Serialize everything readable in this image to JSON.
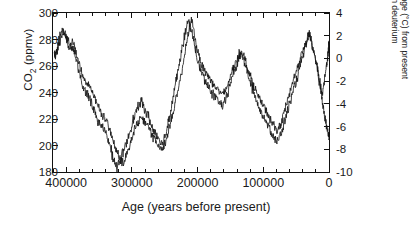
{
  "chart_data": {
    "type": "line",
    "title": "",
    "xlabel": "Age (years before present)",
    "ylabel": "CO2 (ppmv)",
    "ylabel_right_line1": "Temperature change (°C) from present",
    "ylabel_right_line2": "based on deuterium",
    "xlim": [
      420000,
      0
    ],
    "x_reversed": true,
    "ylim": [
      180,
      300
    ],
    "ylim_right": [
      -10,
      4
    ],
    "grid": false,
    "legend": false,
    "xticks": [
      400000,
      300000,
      200000,
      100000,
      0
    ],
    "xtick_labels": [
      "400000",
      "300000",
      "200000",
      "100000",
      "0"
    ],
    "x_minor_tick_interval": 20000,
    "yticks": [
      180,
      200,
      220,
      240,
      260,
      280,
      300
    ],
    "ytick_labels": [
      "180",
      "200",
      "220",
      "240",
      "260",
      "280",
      "300"
    ],
    "yticks_right": [
      -10,
      -8,
      -6,
      -4,
      -2,
      0,
      2,
      4
    ],
    "ytick_labels_right": [
      "-10",
      "-8",
      "-6",
      "-4",
      "-2",
      "0",
      "2",
      "4"
    ],
    "line_color": "#111111",
    "line_width": 0.8,
    "series": [
      {
        "name": "CO2",
        "axis": "left",
        "x": [
          418000,
          414000,
          410000,
          406000,
          402000,
          398000,
          394000,
          390000,
          386000,
          382000,
          378000,
          374000,
          370000,
          366000,
          362000,
          358000,
          354000,
          350000,
          346000,
          342000,
          338000,
          334000,
          330000,
          326000,
          322000,
          318000,
          314000,
          310000,
          306000,
          302000,
          298000,
          294000,
          290000,
          286000,
          282000,
          278000,
          274000,
          270000,
          266000,
          262000,
          258000,
          254000,
          250000,
          246000,
          242000,
          238000,
          234000,
          230000,
          226000,
          222000,
          218000,
          214000,
          210000,
          206000,
          202000,
          198000,
          194000,
          190000,
          186000,
          182000,
          178000,
          174000,
          170000,
          166000,
          162000,
          158000,
          154000,
          150000,
          146000,
          142000,
          138000,
          134000,
          130000,
          126000,
          122000,
          118000,
          114000,
          110000,
          106000,
          102000,
          98000,
          94000,
          90000,
          86000,
          82000,
          78000,
          74000,
          70000,
          66000,
          62000,
          58000,
          54000,
          50000,
          46000,
          42000,
          38000,
          34000,
          30000,
          26000,
          22000,
          18000,
          15000,
          12000,
          10000,
          8000,
          6000,
          4000,
          2000,
          1000,
          0
        ],
        "y": [
          268,
          272,
          278,
          283,
          285,
          281,
          276,
          279,
          272,
          266,
          258,
          252,
          249,
          247,
          243,
          238,
          232,
          228,
          224,
          221,
          218,
          212,
          206,
          199,
          194,
          190,
          187,
          190,
          196,
          203,
          209,
          214,
          218,
          221,
          219,
          216,
          213,
          208,
          205,
          202,
          199,
          197,
          201,
          208,
          216,
          224,
          232,
          241,
          250,
          262,
          273,
          284,
          296,
          288,
          276,
          268,
          262,
          258,
          254,
          251,
          248,
          245,
          243,
          240,
          238,
          241,
          246,
          252,
          258,
          263,
          268,
          272,
          268,
          262,
          256,
          250,
          244,
          240,
          236,
          232,
          228,
          224,
          220,
          217,
          214,
          211,
          215,
          222,
          229,
          236,
          243,
          250,
          256,
          262,
          268,
          274,
          280,
          285,
          278,
          268,
          258,
          248,
          240,
          232,
          226,
          220,
          215,
          212,
          208,
          205
        ],
        "y_notes": "CO2 in ppmv; Vostok-style glacial-interglacial cycles"
      },
      {
        "name": "Temperature (deuterium)",
        "axis": "right",
        "x": [
          418000,
          414000,
          410000,
          406000,
          402000,
          398000,
          394000,
          390000,
          386000,
          382000,
          378000,
          374000,
          370000,
          366000,
          362000,
          358000,
          354000,
          350000,
          346000,
          342000,
          338000,
          334000,
          330000,
          326000,
          322000,
          318000,
          314000,
          310000,
          306000,
          302000,
          298000,
          294000,
          290000,
          286000,
          282000,
          278000,
          274000,
          270000,
          266000,
          262000,
          258000,
          254000,
          250000,
          246000,
          242000,
          238000,
          234000,
          230000,
          226000,
          222000,
          218000,
          214000,
          210000,
          206000,
          202000,
          198000,
          194000,
          190000,
          186000,
          182000,
          178000,
          174000,
          170000,
          166000,
          162000,
          158000,
          154000,
          150000,
          146000,
          142000,
          138000,
          134000,
          130000,
          126000,
          122000,
          118000,
          114000,
          110000,
          106000,
          102000,
          98000,
          94000,
          90000,
          86000,
          82000,
          78000,
          74000,
          70000,
          66000,
          62000,
          58000,
          54000,
          50000,
          46000,
          42000,
          38000,
          34000,
          30000,
          26000,
          22000,
          18000,
          15000,
          12000,
          10000,
          8000,
          6000,
          4000,
          2000,
          1000,
          0
        ],
        "y": [
          0.2,
          0.8,
          1.8,
          2.4,
          2.2,
          1.4,
          0.6,
          1.0,
          0.2,
          -0.8,
          -1.8,
          -2.6,
          -3.0,
          -3.2,
          -3.8,
          -4.4,
          -5.2,
          -5.6,
          -6.0,
          -6.4,
          -6.8,
          -7.6,
          -8.4,
          -9.2,
          -9.6,
          -9.0,
          -8.4,
          -7.8,
          -7.0,
          -6.2,
          -5.4,
          -4.8,
          -4.2,
          -3.8,
          -4.2,
          -4.8,
          -5.2,
          -6.0,
          -6.4,
          -6.8,
          -7.2,
          -7.6,
          -7.0,
          -6.0,
          -4.8,
          -3.6,
          -2.4,
          -1.2,
          0.0,
          1.4,
          2.4,
          3.2,
          2.6,
          1.6,
          0.4,
          -0.6,
          -1.2,
          -1.8,
          -2.2,
          -2.6,
          -3.0,
          -3.4,
          -3.6,
          -4.0,
          -4.2,
          -3.8,
          -3.0,
          -2.2,
          -1.4,
          -0.8,
          -0.2,
          0.4,
          0.0,
          -0.8,
          -1.6,
          -2.4,
          -3.2,
          -3.8,
          -4.4,
          -4.8,
          -5.2,
          -5.8,
          -6.2,
          -6.6,
          -7.0,
          -7.4,
          -6.8,
          -6.0,
          -5.2,
          -4.4,
          -3.6,
          -2.8,
          -2.0,
          -1.2,
          -0.4,
          0.6,
          1.4,
          2.0,
          1.2,
          0.2,
          -0.8,
          -1.8,
          -2.6,
          -3.2,
          -2.4,
          -1.4,
          -0.6,
          0.2,
          0.8,
          1.2
        ],
        "y_notes": "Temperature change in degrees C relative to present"
      }
    ]
  }
}
